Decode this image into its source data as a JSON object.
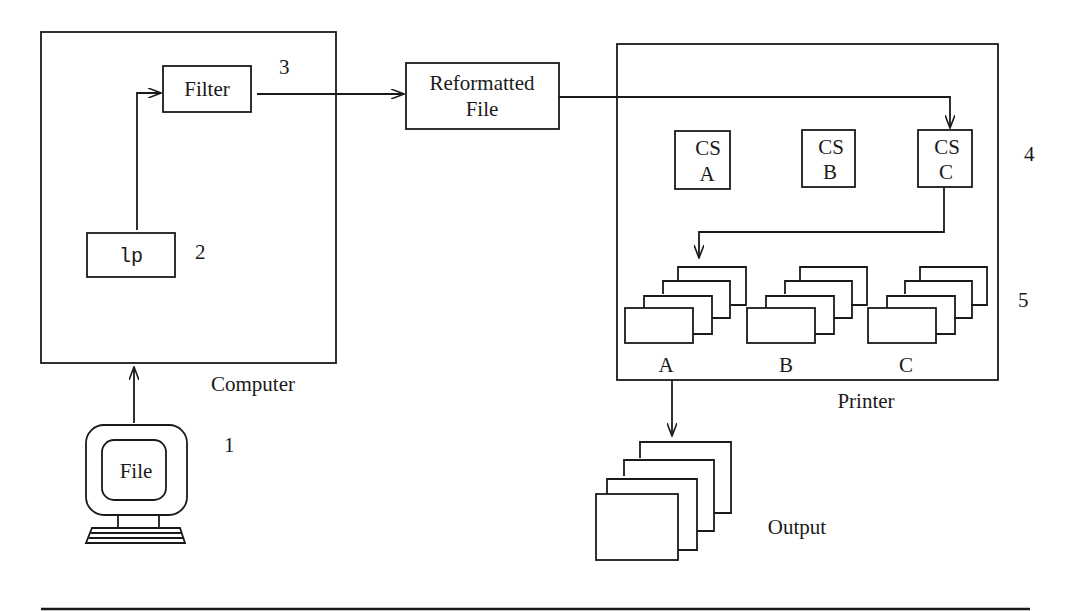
{
  "computer": {
    "label": "Computer",
    "filter_label": "Filter",
    "lp_label": "lp"
  },
  "terminal": {
    "screen_label": "File"
  },
  "reformatted": {
    "line1": "Reformatted",
    "line2": "File"
  },
  "printer": {
    "label": "Printer",
    "char_sets": [
      {
        "line1": "CS",
        "line2": "A"
      },
      {
        "line1": "CS",
        "line2": "B"
      },
      {
        "line1": "CS",
        "line2": "C"
      }
    ],
    "trays": [
      "A",
      "B",
      "C"
    ]
  },
  "output": {
    "label": "Output"
  },
  "step_numbers": {
    "s1": "1",
    "s2": "2",
    "s3": "3",
    "s4": "4",
    "s5": "5"
  }
}
